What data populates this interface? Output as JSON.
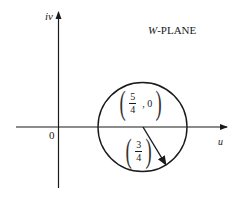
{
  "diagram": {
    "title": "W-PLANE",
    "title_letter": "W",
    "title_rest": "-PLANE",
    "axes": {
      "horizontal_label": "u",
      "vertical_label": "iv",
      "origin_label": "0"
    },
    "circle": {
      "center_label": {
        "numerator": "5",
        "denominator": "4",
        "suffix": ", 0"
      },
      "radius_label": {
        "numerator": "3",
        "denominator": "4"
      },
      "center": [
        1.25,
        0
      ],
      "radius": 0.75
    },
    "colors": {
      "stroke": "#1a1a1a",
      "background": "#ffffff"
    }
  }
}
